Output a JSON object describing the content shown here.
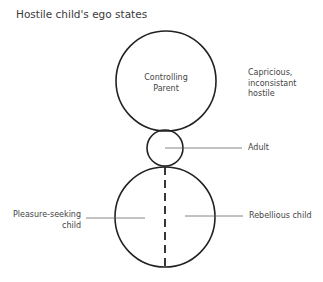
{
  "title": "Hostile child's ego states",
  "diagram": {
    "states": [
      {
        "id": "parent",
        "label_line1": "Controlling",
        "label_line2": "Parent"
      },
      {
        "id": "adult",
        "label": "Adult"
      },
      {
        "id": "child_left",
        "label_line1": "Pleasure-seeking",
        "label_line2": "child"
      },
      {
        "id": "child_right",
        "label": "Rebellious child"
      }
    ],
    "annotation": {
      "line1": "Capricious,",
      "line2": "inconsistant",
      "line3": "hostile"
    }
  }
}
